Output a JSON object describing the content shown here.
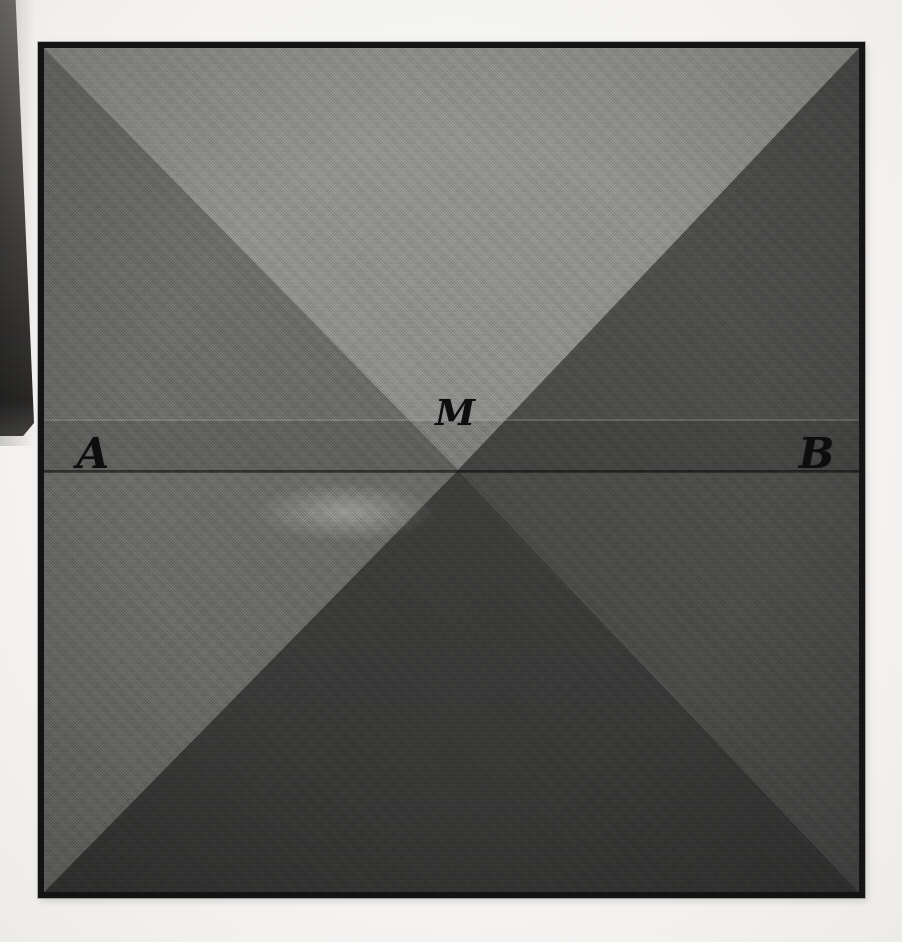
{
  "figure": {
    "kind": "geometric-plate",
    "frame_color": "#121212",
    "page_background": "#f6f5f3"
  },
  "labels": {
    "left_point": "A",
    "right_point": "B",
    "centre_point": "M"
  },
  "regions": [
    {
      "name": "top-triangle",
      "tone": "#8d8d8d"
    },
    {
      "name": "left-triangle",
      "tone": "#6a6a6a"
    },
    {
      "name": "right-triangle",
      "tone": "#4a4a4a"
    },
    {
      "name": "bottom-triangle",
      "tone": "#3c3c3c"
    },
    {
      "name": "lower-left-band",
      "tone": "#a6a6a4"
    },
    {
      "name": "lower-right-band",
      "tone": "#8a8a8a"
    },
    {
      "name": "upper-band",
      "tone": "#7c7c7c"
    }
  ],
  "geometry": {
    "centre_x_pct": 50.8,
    "centre_y_pct": 50.0,
    "chord_y_pct": 50.0,
    "faint_rule_y_pct": 44.0,
    "label_A_left_pct": 4.0,
    "label_A_top_pct": 45.6,
    "label_B_left_pct": 92.6,
    "label_B_top_pct": 45.6,
    "label_M_left_pct": 48.0,
    "label_M_top_pct": 41.0
  },
  "artifact": {
    "name": "left-edge-page-sliver",
    "tone": "#2a2826"
  }
}
